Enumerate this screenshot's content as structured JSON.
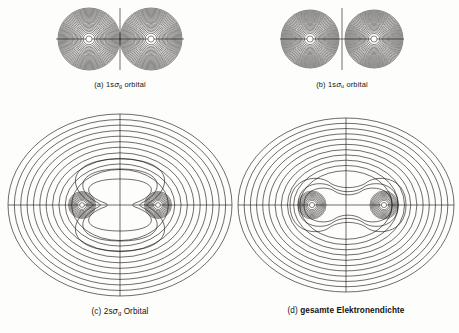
{
  "figure": {
    "type": "contour-plot-grid",
    "background_color": "#fdfdfc",
    "line_color": "#16120f",
    "panel_count": 4
  },
  "panels": [
    {
      "id": "a",
      "label": "(a)",
      "caption_prefix": "(a) 1s",
      "caption_symbol": "σ",
      "caption_subscript": "g",
      "caption_suffix": " orbital",
      "caption_full": "(a) 1sσg orbital",
      "orbital": "1s-sigma-g",
      "character": "bonding",
      "symmetry": "gerade",
      "nodal_plane": false,
      "lobes_merge_at_center": true,
      "nuclei_count": 2,
      "contour_rings_per_lobe": 22
    },
    {
      "id": "b",
      "label": "(b)",
      "caption_prefix": "(b) 1s",
      "caption_symbol": "σ",
      "caption_subscript": "u",
      "caption_suffix": " orbital",
      "caption_full": "(b) 1sσu orbital",
      "orbital": "1s-sigma-u",
      "character": "antibonding",
      "symmetry": "ungerade",
      "nodal_plane": true,
      "lobes_merge_at_center": false,
      "nuclei_count": 2,
      "contour_rings_per_lobe": 22
    },
    {
      "id": "c",
      "label": "(c)",
      "caption_prefix": "(c) 2s",
      "caption_symbol": "σ",
      "caption_subscript": "g",
      "caption_suffix": " Orbital",
      "caption_full": "(c) 2sσg Orbital",
      "orbital": "2s-sigma-g",
      "character": "bonding",
      "symmetry": "gerade",
      "nodal_plane": false,
      "nuclei_count": 2,
      "outer_contour_count": 11,
      "inner_waisted_contour_count": 3,
      "core_rings_per_nucleus": 9
    },
    {
      "id": "d",
      "label": "(d)",
      "caption_prefix": "(d) ",
      "caption_text": "gesamte Elektronendichte",
      "caption_full": "(d) gesamte Elektronendichte",
      "orbital": "total-electron-density",
      "character": "total density",
      "nuclei_count": 2,
      "outer_contour_count": 11,
      "inner_merged_contour_count": 3,
      "core_rings_per_nucleus": 9
    }
  ],
  "chart_data": {
    "type": "contour",
    "title": "",
    "xlabel": "",
    "ylabel": "",
    "grid": false,
    "legend": "none",
    "axes_drawn": [
      "horizontal internuclear axis",
      "vertical perpendicular axis"
    ],
    "panels": [
      {
        "name": "(a) 1sσg orbital",
        "description": "Two dense circular contour lobes centered on each nucleus that merge at the midpoint; no nodal plane; vertical axis line drawn through center.",
        "nuclei_x": [
          -1,
          1
        ],
        "nuclei_y": [
          0,
          0
        ],
        "lobe_radius": 31,
        "contour_levels": 22
      },
      {
        "name": "(b) 1sσu orbital",
        "description": "Two dense circular contour lobes separated by a vertical nodal plane at the midpoint; lobes do not touch.",
        "nuclei_x": [
          -1,
          1
        ],
        "nuclei_y": [
          0,
          0
        ],
        "lobe_radius": 29,
        "contour_levels": 22
      },
      {
        "name": "(c) 2sσg Orbital",
        "description": "Large concentric outer oval contours enclosing both nuclei; inner contours form an hourglass/waisted shape pinched between the nuclei; tight concentric core rings at each nucleus.",
        "nuclei_x": [
          -1,
          1
        ],
        "nuclei_y": [
          0,
          0
        ],
        "outer_levels": 11,
        "inner_levels": 3,
        "core_levels": 9
      },
      {
        "name": "(d) gesamte Elektronendichte",
        "description": "Large concentric outer oval contours enclosing both nuclei; inner contours form a merged peanut/dumbbell shape spanning both nuclei; tight concentric core rings at each nucleus.",
        "nuclei_x": [
          -1,
          1
        ],
        "nuclei_y": [
          0,
          0
        ],
        "outer_levels": 11,
        "inner_levels": 3,
        "core_levels": 9
      }
    ]
  }
}
